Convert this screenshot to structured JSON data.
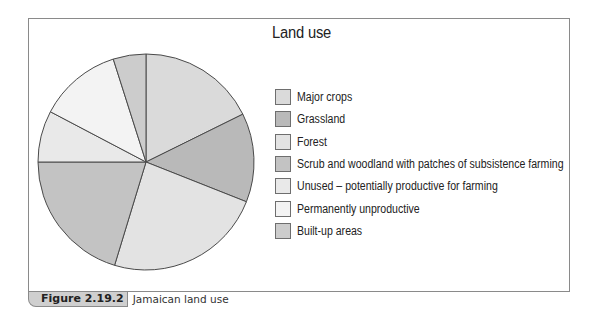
{
  "chart_data": {
    "type": "pie",
    "title": "Land use",
    "start_angle": "12 o'clock",
    "direction": "clockwise",
    "slices": [
      {
        "label": "Major crops",
        "value": 17.7,
        "color": "#dadada"
      },
      {
        "label": "Grassland",
        "value": 13.3,
        "color": "#b9b9b9"
      },
      {
        "label": "Forest",
        "value": 23.7,
        "color": "#e3e3e3"
      },
      {
        "label": "Scrub and woodland with patches of subsistence farming",
        "value": 20.3,
        "color": "#c3c3c3"
      },
      {
        "label": "Unused – potentially productive for farming",
        "value": 7.7,
        "color": "#e9e9e9"
      },
      {
        "label": "Permanently unproductive",
        "value": 12.4,
        "color": "#f3f3f3"
      },
      {
        "label": "Built-up areas",
        "value": 4.9,
        "color": "#cccccc"
      }
    ],
    "legend_position": "right"
  },
  "caption": {
    "figure_label": "Figure 2.19.2",
    "text": "Jamaican land use"
  }
}
